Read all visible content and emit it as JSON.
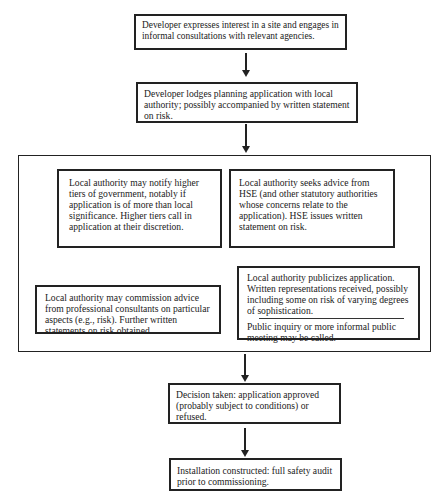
{
  "flowchart": {
    "step1": "Developer expresses interest in a site and engages in informal consultations with relevant agencies.",
    "step2": "Developer lodges planning application with local authority; possibly accompanied by written statement on risk.",
    "parallel": {
      "notify_tiers": "Local authority may notify higher tiers of government, notably if application is of more than local significance. Higher tiers call in application at their discretion.",
      "hse_advice": "Local authority seeks advice from HSE (and other statutory authorities whose concerns relate to the application). HSE issues written statement on risk.",
      "consultants": "Local authority may commission advice from professional consultants on particular aspects (e.g., risk). Further written statements on risk obtained.",
      "publicize": "Local authority publicizes application. Written representations received, possibly including some on risk of varying degrees of sophistication.",
      "public_inquiry": "Public inquiry or more informal public meeting may be called."
    },
    "step4": "Decision taken: application approved (probably subject to conditions) or refused.",
    "step5": "Installation constructed: full safety audit prior to commissioning."
  }
}
